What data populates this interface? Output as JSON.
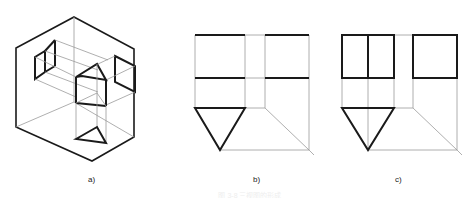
{
  "figure": {
    "subfigures": [
      {
        "id": "a",
        "label": "a)",
        "description": "Isometric view of triangular prism inside three-plane projection box with projections on each plane"
      },
      {
        "id": "b",
        "label": "b)",
        "description": "Three-view drawing, unfolded projection planes with prism projections"
      },
      {
        "id": "c",
        "label": "c)",
        "description": "Three-view drawing with visible rectangular outlines"
      }
    ],
    "caption": "图 3-8 三视图的形成"
  },
  "colors": {
    "thick_line": "#1a1a1a",
    "thin_line": "#9a9a9a",
    "background": "#ffffff"
  }
}
